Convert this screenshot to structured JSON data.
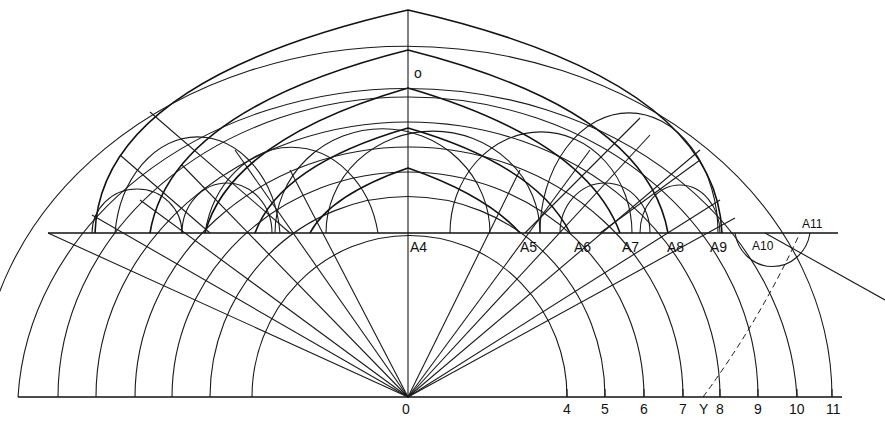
{
  "diagram": {
    "center_label": "O",
    "top_center_label": "o",
    "baseline_labels": [
      {
        "id": "0",
        "text": "0",
        "x": 408
      },
      {
        "id": "4",
        "text": "4",
        "x": 567
      },
      {
        "id": "5",
        "text": "5",
        "x": 605
      },
      {
        "id": "6",
        "text": "6",
        "x": 644
      },
      {
        "id": "7",
        "text": "7",
        "x": 683
      },
      {
        "id": "Y",
        "text": "Y",
        "x": 703
      },
      {
        "id": "8",
        "text": "8",
        "x": 720
      },
      {
        "id": "9",
        "text": "9",
        "x": 758
      },
      {
        "id": "10",
        "text": "10",
        "x": 797
      },
      {
        "id": "11",
        "text": "11",
        "x": 832
      }
    ],
    "upper_line_labels": [
      {
        "id": "A4",
        "text": "A4",
        "x": 410
      },
      {
        "id": "A5",
        "text": "A5",
        "x": 522
      },
      {
        "id": "A6",
        "text": "A6",
        "x": 575
      },
      {
        "id": "A7",
        "text": "A7",
        "x": 623
      },
      {
        "id": "A8",
        "text": "A8",
        "x": 668
      },
      {
        "id": "A9",
        "text": "A9",
        "x": 710
      },
      {
        "id": "A10",
        "text": "A10",
        "x": 753
      },
      {
        "id": "A11",
        "text": "A11",
        "x": 802
      }
    ],
    "colors": {
      "ink": "#111111",
      "paper": "#ffffff"
    }
  }
}
